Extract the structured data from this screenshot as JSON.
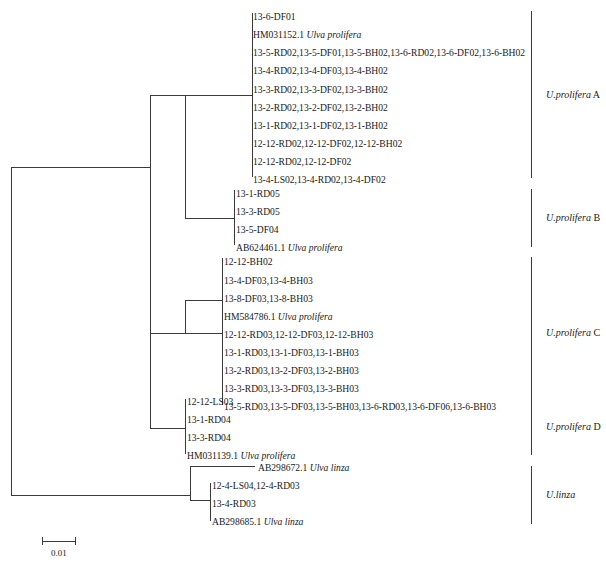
{
  "figure": {
    "type": "phylogenetic-tree",
    "scale_bar": {
      "label": "0.01",
      "x1": 42,
      "x2": 75,
      "y": 541
    },
    "line_color": "#3a3a3a",
    "text_color": "#1a1a1a"
  },
  "leaves": [
    {
      "id": "l1",
      "text": "13-6-DF01",
      "sci": "",
      "x": 253,
      "y": 17
    },
    {
      "id": "l2",
      "text": "HM031152.1 ",
      "sci": "Ulva prolifera",
      "x": 253,
      "y": 35
    },
    {
      "id": "l3",
      "text": "13-5-RD02,13-5-DF01,13-5-BH02,13-6-RD02,13-6-DF02,13-6-BH02",
      "sci": "",
      "x": 253,
      "y": 53
    },
    {
      "id": "l4",
      "text": "13-4-RD02,13-4-DF03,13-4-BH02",
      "sci": "",
      "x": 253,
      "y": 71
    },
    {
      "id": "l5",
      "text": "13-3-RD02,13-3-DF02,13-3-BH02",
      "sci": "",
      "x": 253,
      "y": 90
    },
    {
      "id": "l6",
      "text": "13-2-RD02,13-2-DF02,13-2-BH02",
      "sci": "",
      "x": 253,
      "y": 108
    },
    {
      "id": "l7",
      "text": "13-1-RD02,13-1-DF02,13-1-BH02",
      "sci": "",
      "x": 253,
      "y": 126
    },
    {
      "id": "l8",
      "text": "12-12-RD02,12-12-DF02,12-12-BH02",
      "sci": "",
      "x": 253,
      "y": 144
    },
    {
      "id": "l9",
      "text": "12-12-RD02,12-12-DF02",
      "sci": "",
      "x": 253,
      "y": 162
    },
    {
      "id": "l10",
      "text": "13-4-LS02,13-4-RD02,13-4-DF02",
      "sci": "",
      "x": 253,
      "y": 180
    },
    {
      "id": "l11",
      "text": "13-1-RD05",
      "sci": "",
      "x": 236,
      "y": 194
    },
    {
      "id": "l12",
      "text": "13-3-RD05",
      "sci": "",
      "x": 236,
      "y": 212
    },
    {
      "id": "l13",
      "text": "13-5-DF04",
      "sci": "",
      "x": 236,
      "y": 230
    },
    {
      "id": "l14",
      "text": "AB624461.1 ",
      "sci": "Ulva prolifera",
      "x": 236,
      "y": 248
    },
    {
      "id": "l15",
      "text": "12-12-BH02",
      "sci": "",
      "x": 224,
      "y": 262
    },
    {
      "id": "l16",
      "text": "13-4-DF03,13-4-BH03",
      "sci": "",
      "x": 224,
      "y": 281
    },
    {
      "id": "l17",
      "text": "13-8-DF03,13-8-BH03",
      "sci": "",
      "x": 224,
      "y": 299
    },
    {
      "id": "l18",
      "text": "HM584786.1 ",
      "sci": "Ulva prolifera",
      "x": 224,
      "y": 317
    },
    {
      "id": "l19",
      "text": "12-12-RD03,12-12-DF03,12-12-BH03",
      "sci": "",
      "x": 224,
      "y": 335
    },
    {
      "id": "l20",
      "text": "13-1-RD03,13-1-DF03,13-1-BH03",
      "sci": "",
      "x": 224,
      "y": 353
    },
    {
      "id": "l21",
      "text": "13-2-RD03,13-2-DF03,13-2-BH03",
      "sci": "",
      "x": 224,
      "y": 371
    },
    {
      "id": "l22",
      "text": "13-3-RD03,13-3-DF03,13-3-BH03",
      "sci": "",
      "x": 224,
      "y": 389
    },
    {
      "id": "l23",
      "text": "13-5-RD03,13-5-DF03,13-5-BH03,13-6-RD03,13-6-DF06,13-6-BH03",
      "sci": "",
      "x": 224,
      "y": 407
    },
    {
      "id": "l24",
      "text": "12-12-LS03",
      "sci": "",
      "x": 187,
      "y": 402
    },
    {
      "id": "l25",
      "text": "13-1-RD04",
      "sci": "",
      "x": 187,
      "y": 420
    },
    {
      "id": "l26",
      "text": "13-3-RD04",
      "sci": "",
      "x": 187,
      "y": 438
    },
    {
      "id": "l27",
      "text": "HM031139.1 ",
      "sci": "Ulva prolifera",
      "x": 187,
      "y": 456
    },
    {
      "id": "l28",
      "text": "AB298672.1 ",
      "sci": "Ulva linza",
      "x": 258,
      "y": 468
    },
    {
      "id": "l29",
      "text": "12-4-LS04,12-4-RD03",
      "sci": "",
      "x": 212,
      "y": 486
    },
    {
      "id": "l30",
      "text": "13-4-RD03",
      "sci": "",
      "x": 212,
      "y": 504
    },
    {
      "id": "l31",
      "text": "AB298685.1 ",
      "sci": "Ulva linza",
      "x": 212,
      "y": 522
    }
  ],
  "clades": [
    {
      "id": "cA",
      "genus": "U.prolifera",
      "suffix": " A",
      "bar_x": 531,
      "bar_y1": 11,
      "bar_y2": 178,
      "label_x": 546,
      "label_y": 95
    },
    {
      "id": "cB",
      "genus": "U.prolifera",
      "suffix": " B",
      "bar_x": 531,
      "bar_y1": 189,
      "bar_y2": 247,
      "label_x": 546,
      "label_y": 218
    },
    {
      "id": "cC",
      "genus": "U.prolifera",
      "suffix": " C",
      "bar_x": 531,
      "bar_y1": 257,
      "bar_y2": 408,
      "label_x": 546,
      "label_y": 333
    },
    {
      "id": "cD",
      "genus": "U.prolifera",
      "suffix": " D",
      "bar_x": 531,
      "bar_y1": 398,
      "bar_y2": 455,
      "label_x": 546,
      "label_y": 427
    },
    {
      "id": "cL",
      "genus": "U.linza",
      "suffix": "",
      "bar_x": 531,
      "bar_y1": 466,
      "bar_y2": 524,
      "label_x": 546,
      "label_y": 495
    }
  ],
  "branches": [
    {
      "id": "root-v",
      "x1": 11,
      "y1": 167,
      "x2": 11,
      "y2": 495
    },
    {
      "id": "root-up-h",
      "x1": 11,
      "y1": 167,
      "x2": 150,
      "y2": 167
    },
    {
      "id": "root-dn-h",
      "x1": 11,
      "y1": 495,
      "x2": 190,
      "y2": 495
    },
    {
      "id": "nUP-v",
      "x1": 150,
      "y1": 95,
      "x2": 150,
      "y2": 428
    },
    {
      "id": "nUP-h1",
      "x1": 150,
      "y1": 95,
      "x2": 185,
      "y2": 95
    },
    {
      "id": "nUP-h2",
      "x1": 150,
      "y1": 333,
      "x2": 185,
      "y2": 333
    },
    {
      "id": "nUP-h3",
      "x1": 150,
      "y1": 428,
      "x2": 172,
      "y2": 428
    },
    {
      "id": "nAB-v",
      "x1": 185,
      "y1": 95,
      "x2": 185,
      "y2": 218
    },
    {
      "id": "nAB-hA",
      "x1": 185,
      "y1": 95,
      "x2": 208,
      "y2": 95
    },
    {
      "id": "nAB-hB",
      "x1": 185,
      "y1": 218,
      "x2": 208,
      "y2": 218
    },
    {
      "id": "nA-h",
      "x1": 208,
      "y1": 95,
      "x2": 252,
      "y2": 95
    },
    {
      "id": "nA-bar",
      "x1": 252,
      "y1": 13,
      "x2": 252,
      "y2": 177
    },
    {
      "id": "nB-h",
      "x1": 208,
      "y1": 218,
      "x2": 234,
      "y2": 218
    },
    {
      "id": "nB-bar",
      "x1": 234,
      "y1": 190,
      "x2": 234,
      "y2": 245
    },
    {
      "id": "nC-v",
      "x1": 185,
      "y1": 300,
      "x2": 185,
      "y2": 333
    },
    {
      "id": "nC-h-sub",
      "x1": 185,
      "y1": 300,
      "x2": 222,
      "y2": 300
    },
    {
      "id": "nC-h-main",
      "x1": 185,
      "y1": 333,
      "x2": 222,
      "y2": 333
    },
    {
      "id": "nC-bar",
      "x1": 222,
      "y1": 258,
      "x2": 222,
      "y2": 405
    },
    {
      "id": "nD-h",
      "x1": 172,
      "y1": 428,
      "x2": 185,
      "y2": 428
    },
    {
      "id": "nD-bar",
      "x1": 185,
      "y1": 399,
      "x2": 185,
      "y2": 454
    },
    {
      "id": "nL-v",
      "x1": 190,
      "y1": 466,
      "x2": 190,
      "y2": 500
    },
    {
      "id": "nL-h-top",
      "x1": 190,
      "y1": 466,
      "x2": 255,
      "y2": 466
    },
    {
      "id": "nL-h-bot",
      "x1": 190,
      "y1": 500,
      "x2": 210,
      "y2": 500
    },
    {
      "id": "nL-bar",
      "x1": 210,
      "y1": 483,
      "x2": 210,
      "y2": 521
    }
  ],
  "chart_data": {
    "type": "tree",
    "title": "",
    "scale_bar_value": 0.01,
    "groups": [
      {
        "name": "U.prolifera A",
        "taxa": [
          "13-6-DF01",
          "HM031152.1 Ulva prolifera",
          "13-5-RD02,13-5-DF01,13-5-BH02,13-6-RD02,13-6-DF02,13-6-BH02",
          "13-4-RD02,13-4-DF03,13-4-BH02",
          "13-3-RD02,13-3-DF02,13-3-BH02",
          "13-2-RD02,13-2-DF02,13-2-BH02",
          "13-1-RD02,13-1-DF02,13-1-BH02",
          "12-12-RD02,12-12-DF02,12-12-BH02",
          "12-12-RD02,12-12-DF02",
          "13-4-LS02,13-4-RD02,13-4-DF02"
        ]
      },
      {
        "name": "U.prolifera B",
        "taxa": [
          "13-1-RD05",
          "13-3-RD05",
          "13-5-DF04",
          "AB624461.1 Ulva prolifera"
        ]
      },
      {
        "name": "U.prolifera C",
        "taxa": [
          "12-12-BH02",
          "13-4-DF03,13-4-BH03",
          "13-8-DF03,13-8-BH03",
          "HM584786.1 Ulva prolifera",
          "12-12-RD03,12-12-DF03,12-12-BH03",
          "13-1-RD03,13-1-DF03,13-1-BH03",
          "13-2-RD03,13-2-DF03,13-2-BH03",
          "13-3-RD03,13-3-DF03,13-3-BH03",
          "13-5-RD03,13-5-DF03,13-5-BH03,13-6-RD03,13-6-DF06,13-6-BH03"
        ]
      },
      {
        "name": "U.prolifera D",
        "taxa": [
          "12-12-LS03",
          "13-1-RD04",
          "13-3-RD04",
          "HM031139.1 Ulva prolifera"
        ]
      },
      {
        "name": "U.linza",
        "taxa": [
          "AB298672.1 Ulva linza",
          "12-4-LS04,12-4-RD03",
          "13-4-RD03",
          "AB298685.1 Ulva linza"
        ]
      }
    ]
  }
}
